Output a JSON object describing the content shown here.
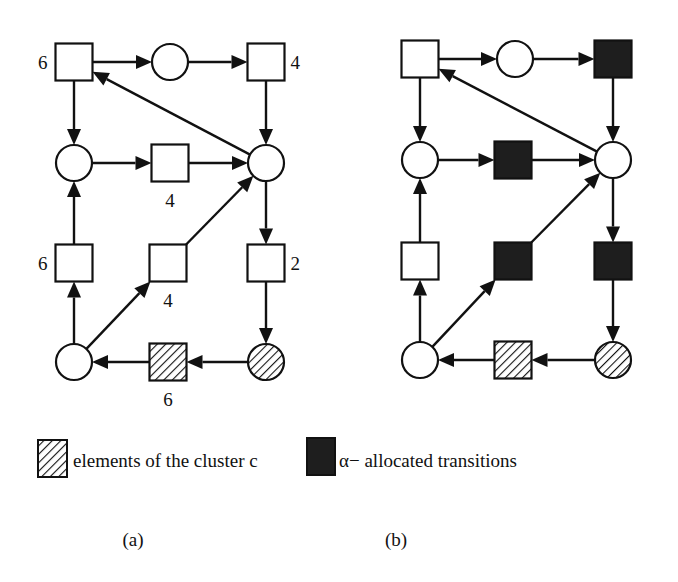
{
  "figure": {
    "panels": [
      {
        "id": "a",
        "caption": "(a)",
        "legend": {
          "symbol": "hatched-square",
          "label": "elements of the cluster c"
        },
        "places": [
          {
            "id": "p_top",
            "cx": 170,
            "cy": 62,
            "style": "plain"
          },
          {
            "id": "p_midleft",
            "cx": 74,
            "cy": 163,
            "style": "plain"
          },
          {
            "id": "p_right",
            "cx": 266,
            "cy": 163,
            "style": "plain"
          },
          {
            "id": "p_bottomleft",
            "cx": 74,
            "cy": 362,
            "style": "plain"
          },
          {
            "id": "p_bottomright",
            "cx": 266,
            "cy": 362,
            "style": "hatched"
          }
        ],
        "transitions": [
          {
            "id": "t_topleft",
            "cx": 74,
            "cy": 62,
            "style": "plain",
            "weight": "6",
            "label_pos": "left"
          },
          {
            "id": "t_topright",
            "cx": 266,
            "cy": 62,
            "style": "plain",
            "weight": "4",
            "label_pos": "right"
          },
          {
            "id": "t_mid",
            "cx": 170,
            "cy": 163,
            "style": "plain",
            "weight": "4",
            "label_pos": "below"
          },
          {
            "id": "t_row3left",
            "cx": 74,
            "cy": 263,
            "style": "plain",
            "weight": "6",
            "label_pos": "left"
          },
          {
            "id": "t_row3mid",
            "cx": 168,
            "cy": 263,
            "style": "plain",
            "weight": "4",
            "label_pos": "below"
          },
          {
            "id": "t_row3right",
            "cx": 266,
            "cy": 263,
            "style": "plain",
            "weight": "2",
            "label_pos": "right"
          },
          {
            "id": "t_bottom",
            "cx": 168,
            "cy": 362,
            "style": "hatched",
            "weight": "6",
            "label_pos": "below"
          }
        ]
      },
      {
        "id": "b",
        "caption": "(b)",
        "legend": {
          "symbol": "dark-square",
          "label": "α− allocated transitions"
        },
        "places": [
          {
            "id": "p_top",
            "cx": 515,
            "cy": 59,
            "style": "plain"
          },
          {
            "id": "p_midleft",
            "cx": 420,
            "cy": 160,
            "style": "plain"
          },
          {
            "id": "p_right",
            "cx": 613,
            "cy": 160,
            "style": "plain"
          },
          {
            "id": "p_bottomleft",
            "cx": 420,
            "cy": 360,
            "style": "plain"
          },
          {
            "id": "p_bottomright",
            "cx": 613,
            "cy": 360,
            "style": "hatched"
          }
        ],
        "transitions": [
          {
            "id": "t_topleft",
            "cx": 420,
            "cy": 59,
            "style": "plain"
          },
          {
            "id": "t_topright",
            "cx": 613,
            "cy": 59,
            "style": "dark"
          },
          {
            "id": "t_mid",
            "cx": 513,
            "cy": 160,
            "style": "dark"
          },
          {
            "id": "t_row3left",
            "cx": 420,
            "cy": 261,
            "style": "plain"
          },
          {
            "id": "t_row3mid",
            "cx": 513,
            "cy": 261,
            "style": "dark"
          },
          {
            "id": "t_row3right",
            "cx": 613,
            "cy": 261,
            "style": "dark"
          },
          {
            "id": "t_bottom",
            "cx": 513,
            "cy": 360,
            "style": "hatched"
          }
        ]
      }
    ],
    "arcs": [
      [
        "t_topleft",
        "p_top"
      ],
      [
        "p_top",
        "t_topright"
      ],
      [
        "t_topright",
        "p_right"
      ],
      [
        "p_right",
        "t_topleft"
      ],
      [
        "t_topleft",
        "p_midleft"
      ],
      [
        "p_midleft",
        "t_mid"
      ],
      [
        "t_mid",
        "p_right"
      ],
      [
        "p_right",
        "t_row3right"
      ],
      [
        "t_row3right",
        "p_bottomright"
      ],
      [
        "p_bottomright",
        "t_bottom"
      ],
      [
        "t_bottom",
        "p_bottomleft"
      ],
      [
        "p_bottomleft",
        "t_row3left"
      ],
      [
        "t_row3left",
        "p_midleft"
      ],
      [
        "p_bottomleft",
        "t_row3mid"
      ],
      [
        "t_row3mid",
        "p_right"
      ]
    ],
    "colors": {
      "stroke": "#111111",
      "dark_fill": "#1e1e1e",
      "background": "#ffffff"
    }
  }
}
